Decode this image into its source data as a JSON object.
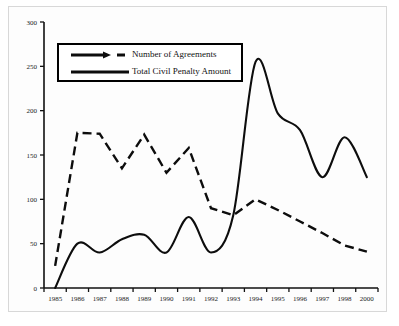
{
  "chart_data": {
    "type": "line",
    "title": "",
    "xlabel": "",
    "ylabel": "",
    "ylim": [
      0,
      300
    ],
    "yticks": [
      0,
      50,
      100,
      150,
      200,
      250,
      300
    ],
    "grid": false,
    "legend_position": "upper-left",
    "categories": [
      "1985",
      "1986",
      "1987",
      "1988",
      "1989",
      "1990",
      "1991",
      "1992",
      "1993",
      "1994",
      "1995",
      "1996",
      "1997",
      "1998",
      "2000"
    ],
    "series": [
      {
        "name": "Number of Agreements",
        "style": "dashed",
        "values": [
          25,
          175,
          174,
          135,
          173,
          130,
          158,
          90,
          82,
          100,
          88,
          75,
          62,
          48,
          41
        ]
      },
      {
        "name": "Total Civil Penalty Amount",
        "style": "solid",
        "values": [
          0,
          50,
          40,
          55,
          60,
          40,
          80,
          40,
          82,
          255,
          197,
          178,
          125,
          170,
          125
        ]
      }
    ]
  },
  "legend": {
    "items": [
      {
        "label": "Number of Agreements",
        "style": "dashed"
      },
      {
        "label": "Total Civil Penalty Amount",
        "style": "solid"
      }
    ]
  },
  "axes": {
    "y_tick_labels": [
      "300",
      "250",
      "200",
      "150",
      "100",
      "50",
      "0"
    ],
    "x_tick_labels": [
      "1985",
      "1986",
      "1987",
      "1988",
      "1989",
      "1990",
      "1991",
      "1992",
      "1993",
      "1994",
      "1995",
      "1996",
      "1997",
      "1998",
      "2000"
    ]
  },
  "colors": {
    "line": "#0d0d0d",
    "axis": "#111111",
    "background": "#ffffff",
    "frame": "#d8d8d8"
  }
}
